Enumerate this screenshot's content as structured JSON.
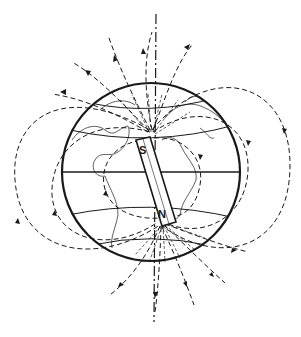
{
  "diagram": {
    "magnet": {
      "top_label": "S",
      "bottom_label": "N"
    },
    "colors": {
      "ink": "#1a1a1a",
      "background": "#ffffff"
    },
    "elements": [
      "globe-outline",
      "equator",
      "latitude-lines",
      "continent-outlines",
      "rotation-axis",
      "bar-magnet",
      "magnetic-field-lines",
      "field-direction-arrows"
    ]
  }
}
